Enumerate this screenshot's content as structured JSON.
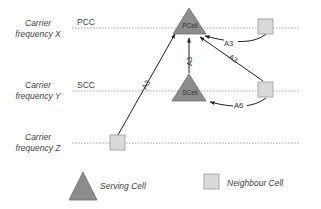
{
  "carriers": [
    {
      "line1": "Carrier",
      "line2": "frequency X",
      "cc": "PCC"
    },
    {
      "line1": "Carrier",
      "line2": "frequency Y",
      "cc": "SCC"
    },
    {
      "line1": "Carrier",
      "line2": "frequency Z",
      "cc": ""
    }
  ],
  "cells": {
    "pcell": "PCell",
    "scell": "SCell"
  },
  "events": {
    "x_neighbour_to_pcell": "A3",
    "y_neighbour_to_pcell": "A3",
    "scell_to_pcell": "A3",
    "z_neighbour_to_pcell": "A3",
    "y_neighbour_to_scell": "A6"
  },
  "legend": {
    "serving": "Serving Cell",
    "neighbour": "Neighbour Cell"
  },
  "colors": {
    "serving_fill": "#8c8c8c",
    "serving_stroke": "#6e6e6e",
    "neighbour_fill": "#dadada",
    "neighbour_stroke": "#9a9a9a",
    "line": "#9a9a9a",
    "arrow": "#222222"
  }
}
